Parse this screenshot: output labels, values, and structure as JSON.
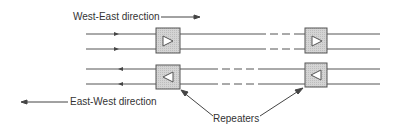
{
  "labels": {
    "west_east": "West-East direction",
    "east_west": "East-West direction",
    "repeaters": "Repeaters"
  },
  "colors": {
    "line": "#444444",
    "box_fill": "#cfcfcf",
    "box_stroke": "#555555"
  }
}
